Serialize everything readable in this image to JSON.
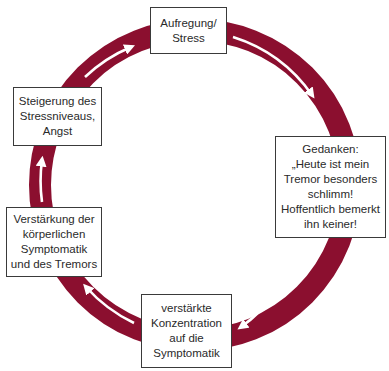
{
  "diagram": {
    "type": "cycle",
    "ring_color": "#8b0f2f",
    "arrow_color": "#ffffff",
    "direction": "clockwise",
    "nodes": [
      {
        "id": "top",
        "label": "Aufregung/\nStress"
      },
      {
        "id": "right",
        "label": "Gedanken:\n„Heute ist mein\nTremor besonders\nschlimm!\nHoffentlich bemerkt\nihn keiner!"
      },
      {
        "id": "bottom",
        "label": "verstärkte\nKonzentration\nauf die\nSymptomatik"
      },
      {
        "id": "lower-left",
        "label": "Verstärkung der\nkörperlichen\nSymptomatik\nund des Tremors"
      },
      {
        "id": "upper-left",
        "label": "Steigerung des\nStressniveaus,\nAngst"
      }
    ],
    "edges": [
      {
        "from": "top",
        "to": "right"
      },
      {
        "from": "right",
        "to": "bottom"
      },
      {
        "from": "bottom",
        "to": "lower-left"
      },
      {
        "from": "lower-left",
        "to": "upper-left"
      },
      {
        "from": "upper-left",
        "to": "top"
      }
    ]
  }
}
